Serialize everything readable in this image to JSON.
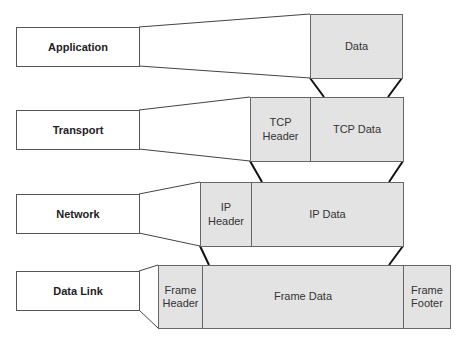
{
  "layers": [
    {
      "name": "Application",
      "segments": [
        {
          "label": "Data"
        }
      ]
    },
    {
      "name": "Transport",
      "segments": [
        {
          "label": "TCP\nHeader"
        },
        {
          "label": "TCP Data"
        }
      ]
    },
    {
      "name": "Network",
      "segments": [
        {
          "label": "IP\nHeader"
        },
        {
          "label": "IP Data"
        }
      ]
    },
    {
      "name": "Data Link",
      "segments": [
        {
          "label": "Frame\nHeader"
        },
        {
          "label": "Frame Data"
        },
        {
          "label": "Frame\nFooter"
        }
      ]
    }
  ],
  "colors": {
    "segment_fill": "#e3e3e3",
    "border": "#555555",
    "connector": "#111111"
  }
}
